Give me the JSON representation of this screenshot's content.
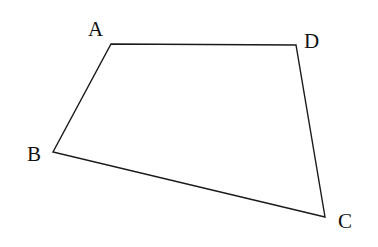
{
  "diagram": {
    "type": "quadrilateral",
    "stroke_color": "#1a1a1a",
    "vertices": [
      {
        "name": "A",
        "x": 111,
        "y": 44,
        "label_x": 88,
        "label_y": 36
      },
      {
        "name": "D",
        "x": 296,
        "y": 45,
        "label_x": 304,
        "label_y": 48
      },
      {
        "name": "C",
        "x": 325,
        "y": 217,
        "label_x": 338,
        "label_y": 228
      },
      {
        "name": "B",
        "x": 53,
        "y": 152,
        "label_x": 27,
        "label_y": 161
      }
    ],
    "labels": {
      "A": "A",
      "B": "B",
      "C": "C",
      "D": "D"
    }
  }
}
